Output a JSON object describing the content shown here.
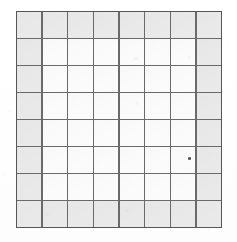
{
  "document": {
    "kind": "scanned-grid-sheet",
    "background_color": "#ffffff"
  },
  "grid": {
    "name": "8x8-grid",
    "columns": 8,
    "rows": 8,
    "bounds": {
      "x": 16,
      "y": 11,
      "width": 206,
      "height": 217
    },
    "line_color": "#6a6a6a",
    "border_color": "#565656",
    "line_width_px": 1.4,
    "cell_fill_interior": "#fbfbfb",
    "cell_fill_shaded": "#e9e9e9",
    "shading_pattern": "border-ring",
    "shading_description": "Outermost ring of cells (top row, bottom row, left column, right column) is filled light gray; the inner 6x6 block of cells is unfilled white.",
    "shaded_cell_count": 28,
    "unshaded_cell_count": 36,
    "cells": [
      [
        1,
        1,
        1,
        1,
        1,
        1,
        1,
        1
      ],
      [
        1,
        0,
        0,
        0,
        0,
        0,
        0,
        1
      ],
      [
        1,
        0,
        0,
        0,
        0,
        0,
        0,
        1
      ],
      [
        1,
        0,
        0,
        0,
        0,
        0,
        0,
        1
      ],
      [
        1,
        0,
        0,
        0,
        0,
        0,
        0,
        1
      ],
      [
        1,
        0,
        0,
        0,
        0,
        0,
        0,
        1
      ],
      [
        1,
        0,
        0,
        0,
        0,
        0,
        0,
        1
      ],
      [
        1,
        1,
        1,
        1,
        1,
        1,
        1,
        1
      ]
    ]
  },
  "artifacts": {
    "specks": [
      {
        "name": "ink-speck",
        "x": 188,
        "y": 157,
        "size": 2.6,
        "opacity": 0.85
      }
    ],
    "smudges": [
      {
        "name": "paper-smudge",
        "x": 134,
        "y": 57,
        "w": 3.5,
        "h": 3.0,
        "opacity": 0.3
      },
      {
        "name": "paper-smudge",
        "x": 188,
        "y": 56,
        "w": 3.0,
        "h": 2.6,
        "opacity": 0.28
      },
      {
        "name": "paper-smudge",
        "x": 136,
        "y": 102,
        "w": 3.2,
        "h": 2.8,
        "opacity": 0.24
      },
      {
        "name": "paper-smudge",
        "x": 125,
        "y": 209,
        "w": 4.0,
        "h": 3.2,
        "opacity": 0.22
      },
      {
        "name": "paper-smudge",
        "x": 46,
        "y": 213,
        "w": 3.0,
        "h": 2.6,
        "opacity": 0.2
      }
    ]
  }
}
